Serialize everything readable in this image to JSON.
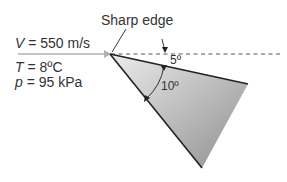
{
  "diagram": {
    "title_label": "Sharp edge",
    "flow": {
      "velocity_symbol": "V",
      "velocity_value": " = 550 m/s",
      "temperature_symbol": "T",
      "temperature_value": " = 8ºC",
      "pressure_symbol": "p",
      "pressure_value": " = 95 kPa"
    },
    "angles": {
      "deflection": "5º",
      "wedge": "10º"
    },
    "colors": {
      "wedge_fill_light": "#e4e4e4",
      "wedge_fill_dark": "#9a9a9a",
      "edge_stroke": "#222222",
      "arrow": "#b0b0b0",
      "dashed_line": "#555555",
      "text": "#333333"
    }
  }
}
